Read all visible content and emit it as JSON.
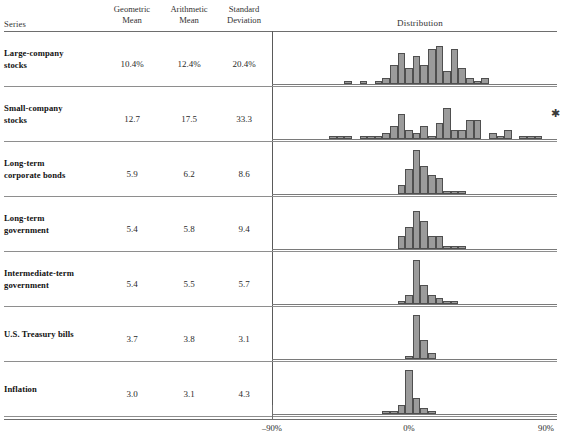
{
  "header": {
    "series_label": "Series",
    "columns": [
      {
        "line1": "Geometric",
        "line2": "Mean"
      },
      {
        "line1": "Arithmetic",
        "line2": "Mean"
      },
      {
        "line1": "Standard",
        "line2": "Deviation"
      }
    ],
    "distribution_label": "Distribution"
  },
  "axis": {
    "labels": [
      "–90%",
      "0%",
      "90%"
    ],
    "min": -90,
    "max": 90,
    "zero": 0
  },
  "footnote_mark": "✱",
  "rows": [
    {
      "label_line1": "Large-company",
      "label_line2": "stocks",
      "geometric_mean": "10.4%",
      "arithmetic_mean": "12.4%",
      "standard_deviation": "20.4%"
    },
    {
      "label_line1": "Small-company",
      "label_line2": "stocks",
      "geometric_mean": "12.7",
      "arithmetic_mean": "17.5",
      "standard_deviation": "33.3"
    },
    {
      "label_line1": "Long-term",
      "label_line2": "corporate bonds",
      "geometric_mean": "5.9",
      "arithmetic_mean": "6.2",
      "standard_deviation": "8.6"
    },
    {
      "label_line1": "Long-term",
      "label_line2": "government",
      "geometric_mean": "5.4",
      "arithmetic_mean": "5.8",
      "standard_deviation": "9.4"
    },
    {
      "label_line1": "Intermediate-term",
      "label_line2": "government",
      "geometric_mean": "5.4",
      "arithmetic_mean": "5.5",
      "standard_deviation": "5.7"
    },
    {
      "label_line1": "U.S. Treasury bills",
      "label_line2": "",
      "geometric_mean": "3.7",
      "arithmetic_mean": "3.8",
      "standard_deviation": "3.1"
    },
    {
      "label_line1": "Inflation",
      "label_line2": "",
      "geometric_mean": "3.0",
      "arithmetic_mean": "3.1",
      "standard_deviation": "4.3"
    }
  ],
  "chart_data": {
    "type": "bar",
    "title": "Distribution",
    "xlabel": "",
    "ylabel": "",
    "xlim": [
      -90,
      90
    ],
    "grid": false,
    "legend": false,
    "bin_width": 5,
    "note": "Seven stacked histograms of annual percent returns; each row shares the same -90% to 90% horizontal axis. Bin centers are given in percent, counts are bar heights in observations.",
    "panels": [
      {
        "name": "Large-company stocks",
        "bin_centers": [
          -45,
          -40,
          -30,
          -25,
          -20,
          -15,
          -10,
          -5,
          0,
          5,
          10,
          15,
          20,
          25,
          30,
          35,
          40,
          45,
          50,
          55
        ],
        "counts": [
          0,
          1,
          1,
          0,
          1,
          2,
          6,
          10,
          5,
          9,
          6,
          11,
          12,
          4,
          11,
          5,
          2,
          1,
          2,
          0
        ]
      },
      {
        "name": "Small-company stocks",
        "bin_centers": [
          -60,
          -55,
          -50,
          -45,
          -40,
          -35,
          -30,
          -25,
          -20,
          -15,
          -10,
          -5,
          0,
          5,
          10,
          15,
          20,
          25,
          30,
          35,
          40,
          45,
          50,
          55,
          60,
          65,
          70,
          75,
          80,
          85,
          90,
          95,
          100,
          140
        ],
        "counts": [
          0,
          0,
          1,
          1,
          1,
          0,
          1,
          1,
          1,
          2,
          4,
          8,
          3,
          2,
          4,
          1,
          5,
          10,
          3,
          3,
          6,
          6,
          0,
          2,
          1,
          3,
          0,
          1,
          1,
          1,
          0,
          0,
          0,
          1
        ]
      },
      {
        "name": "Long-term corporate bonds",
        "bin_centers": [
          -10,
          -5,
          0,
          5,
          10,
          15,
          20,
          25,
          30,
          35,
          40,
          45
        ],
        "counts": [
          0,
          3,
          8,
          14,
          9,
          6,
          5,
          1,
          1,
          1,
          0,
          0
        ]
      },
      {
        "name": "Long-term government",
        "bin_centers": [
          -10,
          -5,
          0,
          5,
          10,
          15,
          20,
          25,
          30,
          35,
          40,
          45
        ],
        "counts": [
          0,
          4,
          7,
          12,
          9,
          4,
          4,
          1,
          1,
          1,
          0,
          0
        ]
      },
      {
        "name": "Intermediate-term government",
        "bin_centers": [
          -10,
          -5,
          0,
          5,
          10,
          15,
          20,
          25,
          30,
          35
        ],
        "counts": [
          0,
          1,
          3,
          14,
          6,
          3,
          2,
          1,
          1,
          0
        ]
      },
      {
        "name": "U.S. Treasury bills",
        "bin_centers": [
          -5,
          0,
          5,
          10,
          15,
          20
        ],
        "counts": [
          0,
          1,
          14,
          6,
          2,
          0
        ]
      },
      {
        "name": "Inflation",
        "bin_centers": [
          -15,
          -10,
          -5,
          0,
          5,
          10,
          15,
          20
        ],
        "counts": [
          1,
          1,
          3,
          14,
          5,
          2,
          1,
          0
        ]
      }
    ]
  }
}
